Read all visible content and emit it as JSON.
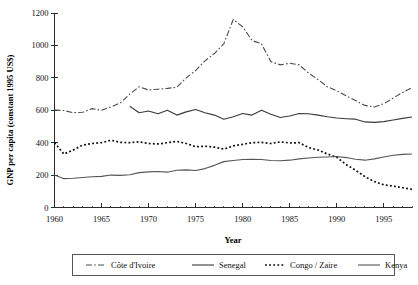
{
  "chart_data": {
    "type": "line",
    "title": "",
    "xlabel": "Year",
    "ylabel": "GNP per capita (constant 1995 US$)",
    "xlim": [
      1960,
      1998
    ],
    "ylim": [
      0,
      1200
    ],
    "ytick_labels": [
      "0",
      "200",
      "400",
      "600",
      "800",
      "1000",
      "1200"
    ],
    "yticks": [
      0,
      200,
      400,
      600,
      800,
      1000,
      1200
    ],
    "xtick_labels": [
      "1960",
      "1965",
      "1970",
      "1975",
      "1980",
      "1985",
      "1990",
      "1995"
    ],
    "xticks": [
      1960,
      1965,
      1970,
      1975,
      1980,
      1985,
      1990,
      1995
    ],
    "x_minor_interval": 1,
    "grid": false,
    "legend_position": "bottom",
    "x": [
      1960,
      1961,
      1962,
      1963,
      1964,
      1965,
      1966,
      1967,
      1968,
      1969,
      1970,
      1971,
      1972,
      1973,
      1974,
      1975,
      1976,
      1977,
      1978,
      1979,
      1980,
      1981,
      1982,
      1983,
      1984,
      1985,
      1986,
      1987,
      1988,
      1989,
      1990,
      1991,
      1992,
      1993,
      1994,
      1995,
      1996,
      1997,
      1998
    ],
    "series": [
      {
        "name": "Côte d'Ivoire",
        "style": "dash-dot",
        "color": "#4a4a4a",
        "values": [
          602,
          598,
          585,
          588,
          610,
          600,
          620,
          645,
          700,
          745,
          725,
          730,
          735,
          742,
          800,
          845,
          905,
          950,
          1010,
          1160,
          1115,
          1030,
          1010,
          900,
          880,
          890,
          880,
          830,
          790,
          745,
          720,
          690,
          660,
          630,
          620,
          640,
          675,
          710,
          740
        ]
      },
      {
        "name": "Senegal",
        "style": "solid",
        "color": "#3a3a3a",
        "values": [
          null,
          null,
          null,
          null,
          null,
          null,
          null,
          null,
          625,
          585,
          595,
          578,
          600,
          570,
          590,
          605,
          585,
          570,
          545,
          560,
          580,
          570,
          600,
          575,
          555,
          565,
          580,
          578,
          570,
          560,
          552,
          548,
          545,
          528,
          525,
          530,
          540,
          550,
          558
        ]
      },
      {
        "name": "Congo / Zaire",
        "style": "dotted",
        "color": "#111111",
        "values": [
          400,
          330,
          355,
          385,
          395,
          400,
          415,
          402,
          400,
          405,
          395,
          392,
          400,
          408,
          395,
          375,
          378,
          372,
          360,
          380,
          390,
          400,
          402,
          395,
          405,
          398,
          400,
          370,
          355,
          330,
          310,
          265,
          230,
          190,
          160,
          140,
          132,
          122,
          112
        ]
      },
      {
        "name": "Kenya",
        "style": "solid",
        "color": "#555555",
        "values": [
          200,
          178,
          180,
          185,
          190,
          192,
          200,
          198,
          202,
          215,
          220,
          222,
          218,
          230,
          232,
          228,
          240,
          260,
          283,
          290,
          296,
          298,
          296,
          290,
          288,
          292,
          300,
          305,
          310,
          312,
          315,
          308,
          298,
          292,
          300,
          312,
          322,
          328,
          330
        ]
      }
    ]
  },
  "legend": {
    "entries": [
      {
        "label": "Côte d'Ivoire",
        "style": "dash-dot"
      },
      {
        "label": "Senegal",
        "style": "solid"
      },
      {
        "label": "Congo / Zaire",
        "style": "dotted"
      },
      {
        "label": "Kenya",
        "style": "solid"
      }
    ]
  },
  "axes": {
    "y_title": "GNP per capita (constant 1995 US$)",
    "x_title": "Year"
  }
}
